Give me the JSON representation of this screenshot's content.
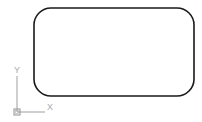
{
  "app": {
    "window_title": "CAD Viewport",
    "background_color": "#ffffff"
  },
  "drawing": {
    "entities": [
      {
        "name": "rounded-rectangle",
        "type": "polyline-filleted-rectangle",
        "color": "#1a1a1a",
        "line_width": 1.6,
        "x": 34,
        "y": 8,
        "width": 160,
        "height": 88,
        "corner_radius": 17
      }
    ]
  },
  "ucs_icon": {
    "name": "ucs-axis-icon",
    "color": "#a8a8a8",
    "origin_x": 17,
    "origin_y": 112,
    "x_axis_length": 28,
    "y_axis_length": 36,
    "origin_box_size": 6,
    "x_label": "X",
    "y_label": "Y"
  }
}
